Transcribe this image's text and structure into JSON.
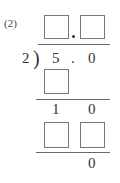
{
  "problem": {
    "number_label": "(2)",
    "divisor": "2",
    "bracket": ")",
    "dividend": {
      "int_digit": "5",
      "decimal_point": ".",
      "decimal_digit": "0"
    },
    "quotient_boxes": [
      "",
      ""
    ],
    "step1": {
      "product_boxes": [
        ""
      ],
      "remainder": [
        "1",
        "0"
      ]
    },
    "step2": {
      "product_boxes": [
        "",
        ""
      ],
      "remainder": "0"
    }
  }
}
